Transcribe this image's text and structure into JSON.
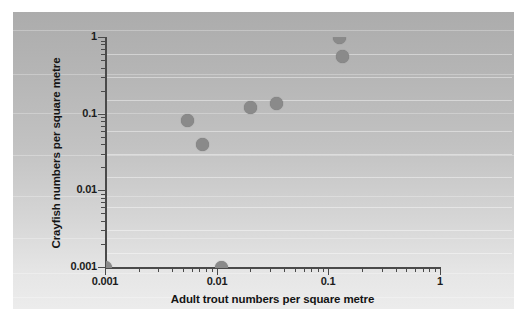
{
  "figure": {
    "background_color": "#ffffff",
    "panel_gradient_top": "#acacac",
    "panel_gradient_bottom": "#ececec",
    "marker_color": "#8a8a8a",
    "axis_color": "#4a4a4a"
  },
  "axes": {
    "x_title": "Adult trout numbers per square metre",
    "y_title": "Crayfish numbers per square metre",
    "x_ticklabels": [
      "0.001",
      "0.01",
      "0.1",
      "1"
    ],
    "y_ticklabels": [
      "0.001",
      "0.01",
      "0.1",
      "1"
    ],
    "x_scale": "log",
    "y_scale": "log"
  },
  "chart_data": {
    "type": "scatter",
    "title": "",
    "xlabel": "Adult trout numbers per square metre",
    "ylabel": "Crayfish numbers per square metre",
    "xscale": "log",
    "yscale": "log",
    "xlim": [
      0.001,
      1
    ],
    "ylim": [
      0.001,
      1
    ],
    "xticks": [
      0.001,
      0.01,
      0.1,
      1
    ],
    "yticks": [
      0.001,
      0.01,
      0.1,
      1
    ],
    "xticklabels": [
      "0.001",
      "0.01",
      "0.1",
      "1"
    ],
    "yticklabels": [
      "0.001",
      "0.01",
      "0.1",
      "1"
    ],
    "grid": true,
    "grid_axis": "y",
    "legend": false,
    "marker": "circle",
    "marker_color": "#8a8a8a",
    "marker_size": 13,
    "series": [
      {
        "name": "Crayfish vs adult trout density",
        "points": [
          {
            "x": 0.001,
            "y": 0.001,
            "note": "clipped at lower-left corner of axes"
          },
          {
            "x": 0.0055,
            "y": 0.082
          },
          {
            "x": 0.0075,
            "y": 0.04
          },
          {
            "x": 0.011,
            "y": 0.001,
            "note": "clipped on x-axis baseline"
          },
          {
            "x": 0.02,
            "y": 0.12
          },
          {
            "x": 0.034,
            "y": 0.135
          },
          {
            "x": 0.125,
            "y": 1.0,
            "note": "clipped at top of axes"
          },
          {
            "x": 0.135,
            "y": 0.55
          }
        ]
      }
    ]
  },
  "gridlines_y": [
    0.0015,
    0.003,
    0.006,
    0.015,
    0.03,
    0.06,
    0.15,
    0.3,
    0.6
  ],
  "scanline_positions_pct": [
    6,
    21,
    34,
    48,
    62,
    76,
    88,
    96
  ]
}
